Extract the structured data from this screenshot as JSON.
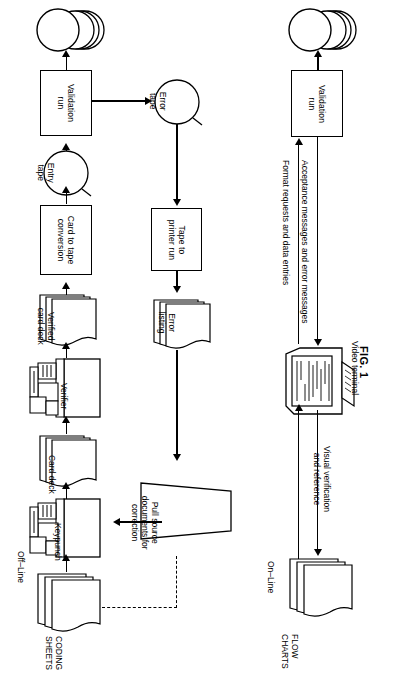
{
  "figure": {
    "caption": "FIG. 1",
    "sections": [
      {
        "id": "off-line",
        "label": "Off–Line"
      },
      {
        "id": "on-line",
        "label": "On–Line"
      }
    ]
  },
  "offline_flow": {
    "nodes": [
      {
        "id": "coding-sheets",
        "type": "document-stack",
        "label": "CODING\nSHEETS",
        "label_position": "outside"
      },
      {
        "id": "keypunch",
        "type": "manual-input-machine",
        "label": "Keypunch"
      },
      {
        "id": "card-deck",
        "type": "document-stack",
        "label": "Card deck",
        "label_position": "inside"
      },
      {
        "id": "verifier",
        "type": "manual-input-machine",
        "label": "Verifier"
      },
      {
        "id": "verified-card-deck",
        "type": "document-stack",
        "label": "Verified\ncard deck",
        "label_position": "inside"
      },
      {
        "id": "card-to-tape-conversion",
        "type": "process",
        "label": "Card to tape\nconversion"
      },
      {
        "id": "entry-tape",
        "type": "magnetic-tape",
        "label": "Entry\ntape"
      },
      {
        "id": "validation-run-offline",
        "type": "process",
        "label": "Validation\nrun"
      },
      {
        "id": "master-file-offline",
        "type": "disk-stack",
        "label": ""
      },
      {
        "id": "error-tape",
        "type": "magnetic-tape",
        "label": "Error\ntape"
      },
      {
        "id": "tape-to-printer-run",
        "type": "process",
        "label": "Tape to\nprinter run"
      },
      {
        "id": "error-listing",
        "type": "document-stack",
        "label": "Error\nlisting",
        "label_position": "inside"
      },
      {
        "id": "pull-source-documents",
        "type": "manual-operation",
        "label": "Pull source\ndocuments for\ncorrection"
      }
    ],
    "edges": [
      {
        "from": "coding-sheets",
        "to": "keypunch",
        "style": "solid"
      },
      {
        "from": "keypunch",
        "to": "card-deck",
        "style": "solid"
      },
      {
        "from": "card-deck",
        "to": "verifier",
        "style": "solid"
      },
      {
        "from": "verifier",
        "to": "verified-card-deck",
        "style": "solid"
      },
      {
        "from": "verified-card-deck",
        "to": "card-to-tape-conversion",
        "style": "solid"
      },
      {
        "from": "card-to-tape-conversion",
        "to": "entry-tape",
        "style": "solid"
      },
      {
        "from": "entry-tape",
        "to": "validation-run-offline",
        "style": "solid"
      },
      {
        "from": "validation-run-offline",
        "to": "master-file-offline",
        "style": "solid"
      },
      {
        "from": "validation-run-offline",
        "to": "error-tape",
        "style": "solid"
      },
      {
        "from": "error-tape",
        "to": "tape-to-printer-run",
        "style": "solid"
      },
      {
        "from": "tape-to-printer-run",
        "to": "error-listing",
        "style": "solid"
      },
      {
        "from": "error-listing",
        "to": "pull-source-documents",
        "style": "solid"
      },
      {
        "from": "pull-source-documents",
        "to": "keypunch",
        "style": "solid"
      },
      {
        "from": "pull-source-documents",
        "to": "coding-sheets",
        "style": "dashed"
      }
    ]
  },
  "online_flow": {
    "nodes": [
      {
        "id": "flow-charts",
        "type": "document-stack",
        "label": "FLOW\nCHARTS",
        "label_position": "outside"
      },
      {
        "id": "video-terminal",
        "type": "video-terminal",
        "label": "Video terminal"
      },
      {
        "id": "validation-run-online",
        "type": "process",
        "label": "Validation\nrun"
      },
      {
        "id": "master-file-online",
        "type": "disk-stack",
        "label": ""
      }
    ],
    "edges": [
      {
        "from": "flow-charts",
        "to": "video-terminal",
        "label": "Visual verification\nand reference",
        "style": "solid"
      },
      {
        "from": "video-terminal",
        "to": "validation-run-online",
        "label": "Format requests and data entries",
        "style": "solid"
      },
      {
        "from": "validation-run-online",
        "to": "video-terminal",
        "label": "Acceptance messages and error messages",
        "style": "solid"
      },
      {
        "from": "validation-run-online",
        "to": "master-file-online",
        "style": "solid"
      }
    ]
  },
  "labels": {
    "off_line": "Off–Line",
    "on_line": "On–Line",
    "coding_sheets": "CODING\nSHEETS",
    "coding_sheets_l1": "CODING",
    "coding_sheets_l2": "SHEETS",
    "keypunch": "Keypunch",
    "card_deck": "Card deck",
    "verifier": "Verifier",
    "verified_card_deck_l1": "Verified",
    "verified_card_deck_l2": "card deck",
    "card_to_tape_l1": "Card to tape",
    "card_to_tape_l2": "conversion",
    "entry_tape_l1": "Entry",
    "entry_tape_l2": "tape",
    "validation_run_l1": "Validation",
    "validation_run_l2": "run",
    "error_tape_l1": "Error",
    "error_tape_l2": "tape",
    "tape_to_printer_l1": "Tape to",
    "tape_to_printer_l2": "printer run",
    "error_listing_l1": "Error",
    "error_listing_l2": "listing",
    "pull_source_l1": "Pull source",
    "pull_source_l2": "documents for",
    "pull_source_l3": "correction",
    "format_requests": "Format requests and data entries",
    "acceptance_messages": "Acceptance messages and error messages",
    "visual_verification_l1": "Visual verification",
    "visual_verification_l2": "and reference",
    "video_terminal": "Video terminal",
    "flow_charts_l1": "FLOW",
    "flow_charts_l2": "CHARTS",
    "fig_caption": "FIG. 1"
  },
  "colors": {
    "ink": "#000000",
    "paper": "#ffffff",
    "shade": "#f2f2f2"
  }
}
